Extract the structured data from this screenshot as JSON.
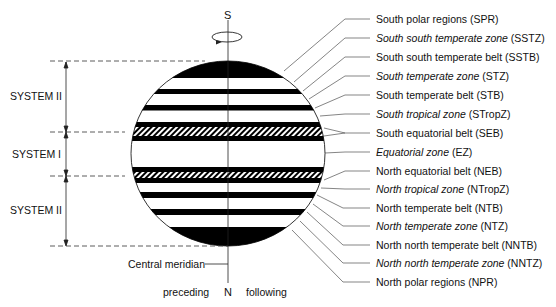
{
  "axis": {
    "top_label": "S",
    "bottom_label": "N",
    "left_label": "preceding",
    "right_label": "following",
    "meridian_label": "Central meridian"
  },
  "systems": [
    {
      "label": "SYSTEM II",
      "y": 96
    },
    {
      "label": "SYSTEM I",
      "y": 154
    },
    {
      "label": "SYSTEM II",
      "y": 210
    }
  ],
  "regions": [
    {
      "name": "South polar regions",
      "abbr": "(SPR)",
      "italic": false,
      "y": 19,
      "ty": 71
    },
    {
      "name": "South south temperate zone",
      "abbr": "(SSTZ)",
      "italic": true,
      "y": 38,
      "ty": 82
    },
    {
      "name": "South south temperate belt",
      "abbr": "(SSTB)",
      "italic": false,
      "y": 57,
      "ty": 91
    },
    {
      "name": "South temperate zone",
      "abbr": "(STZ)",
      "italic": true,
      "y": 76,
      "ty": 99
    },
    {
      "name": "South temperate belt",
      "abbr": "(STB)",
      "italic": false,
      "y": 95,
      "ty": 108
    },
    {
      "name": "South tropical zone",
      "abbr": "(STropZ)",
      "italic": true,
      "y": 114,
      "ty": 116
    },
    {
      "name": "South equatorial belt",
      "abbr": "(SEB)",
      "italic": false,
      "y": 133,
      "ty": 131
    },
    {
      "name": "Equatorial zone",
      "abbr": "(EZ)",
      "italic": true,
      "y": 152,
      "ty": 153
    },
    {
      "name": "North equatorial belt",
      "abbr": "(NEB)",
      "italic": false,
      "y": 171,
      "ty": 175
    },
    {
      "name": "North tropical zone",
      "abbr": "(NTropZ)",
      "italic": true,
      "y": 189,
      "ty": 188
    },
    {
      "name": "North temperate belt",
      "abbr": "(NTB)",
      "italic": false,
      "y": 208,
      "ty": 195
    },
    {
      "name": "North temperate zone",
      "abbr": "(NTZ)",
      "italic": true,
      "y": 226,
      "ty": 204
    },
    {
      "name": "North north temperate belt",
      "abbr": "(NNTB)",
      "italic": false,
      "y": 245,
      "ty": 212
    },
    {
      "name": "North north temperate zone",
      "abbr": "(NNTZ)",
      "italic": true,
      "y": 263,
      "ty": 221
    },
    {
      "name": "North polar regions",
      "abbr": "(NPR)",
      "italic": false,
      "y": 282,
      "ty": 230
    }
  ]
}
